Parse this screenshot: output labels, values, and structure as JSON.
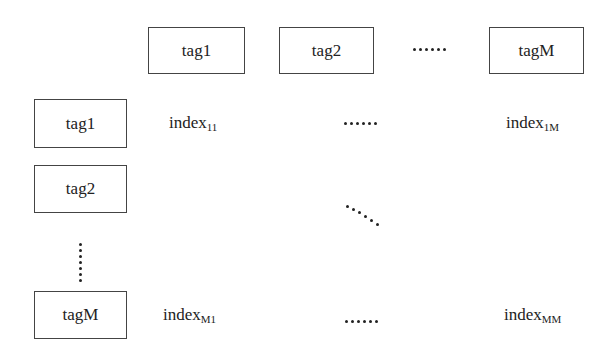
{
  "column_headers": [
    {
      "label": "tag1"
    },
    {
      "label": "tag2"
    },
    {
      "label": "......"
    },
    {
      "label": "tagM"
    }
  ],
  "row_headers": [
    {
      "label": "tag1"
    },
    {
      "label": "tag2"
    },
    {
      "label": "⋮"
    },
    {
      "label": "tagM"
    }
  ],
  "cells": {
    "r1c1": {
      "base": "index",
      "sub": "11"
    },
    "r1c2": {
      "label": "......"
    },
    "r1cM": {
      "base": "index",
      "sub": "1M"
    },
    "diag": {
      "label": "⋱"
    },
    "rMc1": {
      "base": "index",
      "sub": "M1"
    },
    "rMc2": {
      "label": "......"
    },
    "rMcM": {
      "base": "index",
      "sub": "MM"
    }
  }
}
